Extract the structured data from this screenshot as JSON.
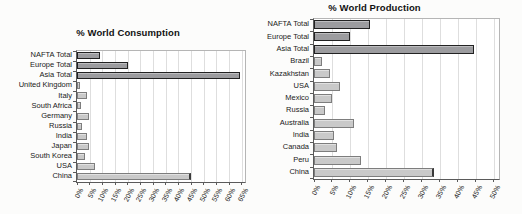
{
  "colors": {
    "bar_total_fill": "#9c9c9f",
    "bar_total_border": "#222222",
    "bar_country_fill": "#c9c9c9",
    "bar_country_border": "#7d7d7d",
    "bar_endcap": "#3a3a3a",
    "gridline": "#dedede",
    "axis": "#5a5a5a",
    "text": "#1a1a1a"
  },
  "chart_data": [
    {
      "type": "bar",
      "orientation": "horizontal",
      "title": "% World Consumption",
      "xlabel": "",
      "ylabel": "",
      "grid": true,
      "xlim": [
        0,
        66.3
      ],
      "grid_step": 5,
      "ticks": [
        "0%",
        "5%",
        "10%",
        "15%",
        "20%",
        "25%",
        "30%",
        "35%",
        "40%",
        "45%",
        "50%",
        "55%",
        "60%",
        "65%"
      ],
      "items": [
        {
          "label": "NAFTA Total",
          "value": 9,
          "style": "dark"
        },
        {
          "label": "Europe Total",
          "value": 20,
          "style": "dark"
        },
        {
          "label": "Asia Total",
          "value": 64.5,
          "style": "dark"
        },
        {
          "label": "United Kingdom",
          "value": 1.1,
          "style": "light"
        },
        {
          "label": "Italy",
          "value": 3.8,
          "style": "light"
        },
        {
          "label": "South Africa",
          "value": 1.5,
          "style": "light"
        },
        {
          "label": "Germany",
          "value": 4.9,
          "style": "light"
        },
        {
          "label": "Russia",
          "value": 1.8,
          "style": "light"
        },
        {
          "label": "India",
          "value": 4.1,
          "style": "light"
        },
        {
          "label": "Japan",
          "value": 4.6,
          "style": "light"
        },
        {
          "label": "South Korea",
          "value": 3.3,
          "style": "light"
        },
        {
          "label": "USA",
          "value": 7.2,
          "style": "light"
        },
        {
          "label": "China",
          "value": 45,
          "style": "light",
          "endcap": true
        }
      ]
    },
    {
      "type": "bar",
      "orientation": "horizontal",
      "title": "% World Production",
      "xlabel": "",
      "ylabel": "",
      "grid": true,
      "xlim": [
        0,
        51.5
      ],
      "grid_step": 5,
      "ticks": [
        "0%",
        "5%",
        "10%",
        "15%",
        "20%",
        "25%",
        "30%",
        "35%",
        "40%",
        "45%",
        "50%"
      ],
      "items": [
        {
          "label": "NAFTA Total",
          "value": 15.5,
          "style": "dark"
        },
        {
          "label": "Europe Total",
          "value": 10,
          "style": "dark"
        },
        {
          "label": "Asia Total",
          "value": 44.5,
          "style": "dark"
        },
        {
          "label": "Brazil",
          "value": 2.1,
          "style": "light"
        },
        {
          "label": "Kazakhstan",
          "value": 4.5,
          "style": "light"
        },
        {
          "label": "USA",
          "value": 7.3,
          "style": "light"
        },
        {
          "label": "Mexico",
          "value": 5,
          "style": "light"
        },
        {
          "label": "Russia",
          "value": 3.1,
          "style": "light"
        },
        {
          "label": "Australia",
          "value": 11.2,
          "style": "light"
        },
        {
          "label": "India",
          "value": 5.5,
          "style": "light"
        },
        {
          "label": "Canada",
          "value": 6.3,
          "style": "light"
        },
        {
          "label": "Peru",
          "value": 13,
          "style": "light"
        },
        {
          "label": "China",
          "value": 33.5,
          "style": "light",
          "endcap": true
        }
      ]
    }
  ]
}
